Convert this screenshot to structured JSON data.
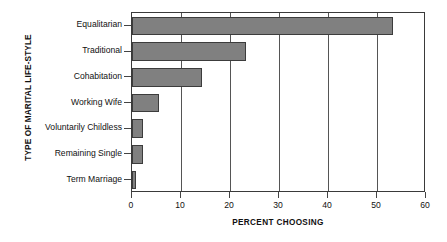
{
  "chart_data": {
    "type": "bar",
    "orientation": "horizontal",
    "title": "",
    "xlabel": "PERCENT CHOOSING",
    "ylabel": "TYPE OF MARITAL LIFE-STYLE",
    "categories": [
      "Equalitarian",
      "Traditional",
      "Cohabitation",
      "Working Wife",
      "Voluntarily Childless",
      "Remaining Single",
      "Term Marriage"
    ],
    "values": [
      53.3,
      23.3,
      14.2,
      5.6,
      2.3,
      2.3,
      0.8
    ],
    "xlim": [
      0,
      60
    ],
    "xticks": [
      0,
      10,
      20,
      30,
      40,
      50,
      60
    ],
    "xtick_labels": [
      "0",
      "10",
      "20",
      "30",
      "40",
      "50",
      "60"
    ],
    "grid": "vertical",
    "legend": "none",
    "bar_color": "#808080",
    "bar_edge_color": "#3c3c3c",
    "axis_color": "#3a3a3a",
    "background_color": "#ffffff"
  }
}
